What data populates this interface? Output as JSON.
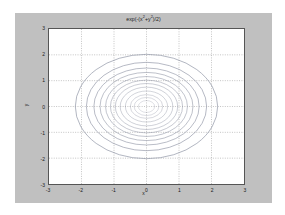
{
  "figure": {
    "background_color": "#c0c0c0",
    "axes_background_color": "#ffffff",
    "axes_border_color": "#555555"
  },
  "chart_data": {
    "type": "line",
    "subtype": "contour",
    "title": "exp(-(x",
    "title_full": "exp(-(x^2+y^2)/2)",
    "title_parts": {
      "lead": "exp(-(x",
      "sup1": "2",
      "mid": "+y",
      "sup2": "2",
      "tail": ")/2)"
    },
    "xlabel": "x",
    "ylabel": "y",
    "xlim": [
      -3,
      3
    ],
    "ylim": [
      -3,
      3
    ],
    "grid": true,
    "grid_style": "dotted",
    "grid_color": "#9a9a9a",
    "legend": null,
    "contour_color": "#8a8fa0",
    "function": "z = exp(-(x^2+y^2)/2)",
    "xticks": [
      -3,
      -2,
      -1,
      0,
      1,
      2,
      3
    ],
    "yticks": [
      -3,
      -2,
      -1,
      0,
      1,
      2,
      3
    ],
    "xtick_labels": [
      "-3",
      "-2",
      "-1",
      "0",
      "1",
      "2",
      "3"
    ],
    "ytick_labels": [
      "3",
      "2",
      "1",
      "0",
      "-1",
      "-2",
      "-3"
    ],
    "contour_levels": [
      0.09,
      0.18,
      0.27,
      0.36,
      0.45,
      0.54,
      0.63,
      0.72,
      0.81,
      0.88,
      0.93,
      0.97
    ],
    "contour_radii_x": [
      2.19,
      1.85,
      1.62,
      1.43,
      1.26,
      1.11,
      0.96,
      0.81,
      0.65,
      0.5,
      0.38,
      0.25
    ],
    "contour_radii_y": [
      2.02,
      1.71,
      1.49,
      1.32,
      1.16,
      1.02,
      0.89,
      0.75,
      0.6,
      0.46,
      0.35,
      0.23
    ],
    "n_contours": 12
  }
}
